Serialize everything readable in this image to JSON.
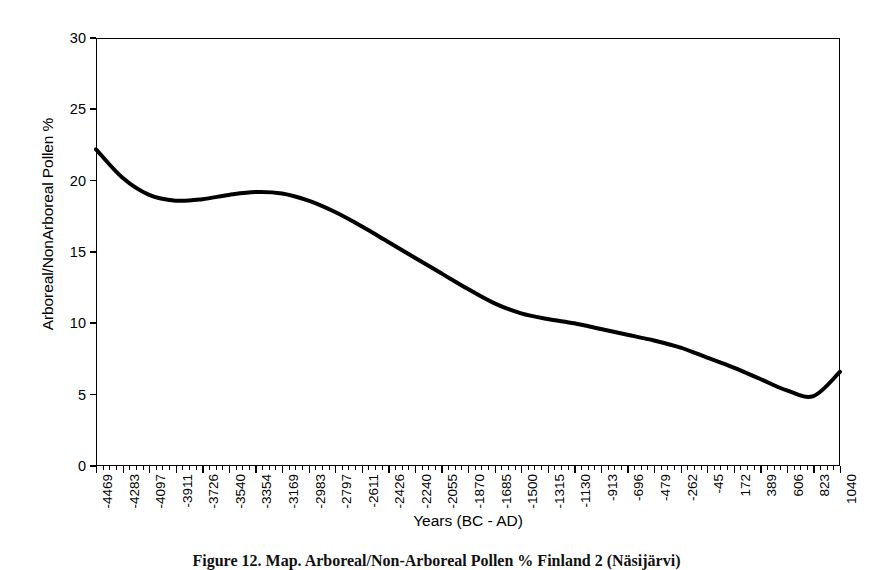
{
  "figure": {
    "caption": "Figure 12. Map. Arboreal/Non-Arboreal Pollen % Finland 2 (Näsijärvi)",
    "background_color": "#ffffff",
    "line_color": "#000000",
    "frame_color": "#000000"
  },
  "chart_data": {
    "type": "line",
    "title": "",
    "xlabel": "Years (BC - AD)",
    "ylabel": "Arboreal/NonArboreal Pollen %",
    "ylim": [
      0,
      30
    ],
    "yticks": [
      0,
      5,
      10,
      15,
      20,
      25,
      30
    ],
    "ytick_labels": [
      "0",
      "5",
      "10",
      "15",
      "20",
      "25",
      "30"
    ],
    "grid": false,
    "legend": false,
    "legend_position": "none",
    "x_tick_labels": [
      "-4469",
      "-4283",
      "-4097",
      "-3911",
      "-3726",
      "-3540",
      "-3354",
      "-3169",
      "-2983",
      "-2797",
      "-2611",
      "-2426",
      "-2240",
      "-2055",
      "-1870",
      "-1685",
      "-1500",
      "-1315",
      "-1130",
      "-913",
      "-696",
      "-479",
      "-262",
      "-45",
      "172",
      "389",
      "606",
      "823",
      "1040"
    ],
    "x": [
      -4469,
      -4283,
      -4097,
      -3911,
      -3726,
      -3540,
      -3354,
      -3169,
      -2983,
      -2797,
      -2611,
      -2426,
      -2240,
      -2055,
      -1870,
      -1685,
      -1500,
      -1315,
      -1130,
      -913,
      -696,
      -479,
      -262,
      -45,
      172,
      389,
      606,
      823,
      1040
    ],
    "values": [
      22.2,
      20.2,
      19.0,
      18.6,
      18.7,
      19.0,
      19.2,
      19.1,
      18.6,
      17.8,
      16.8,
      15.7,
      14.6,
      13.5,
      12.4,
      11.4,
      10.7,
      10.3,
      10.0,
      9.6,
      9.2,
      8.8,
      8.3,
      7.6,
      6.9,
      6.1,
      5.3,
      4.9,
      6.6
    ],
    "series": [
      {
        "name": "Arboreal/NonArboreal Pollen %",
        "values": [
          22.2,
          20.2,
          19.0,
          18.6,
          18.7,
          19.0,
          19.2,
          19.1,
          18.6,
          17.8,
          16.8,
          15.7,
          14.6,
          13.5,
          12.4,
          11.4,
          10.7,
          10.3,
          10.0,
          9.6,
          9.2,
          8.8,
          8.3,
          7.6,
          6.9,
          6.1,
          5.3,
          4.9,
          6.6
        ]
      }
    ],
    "annotations": {
      "start_value": 22.2,
      "local_minimum_early": 18.6,
      "local_maximum_mid": 19.2,
      "global_minimum": 4.9,
      "end_value": 6.6
    }
  }
}
